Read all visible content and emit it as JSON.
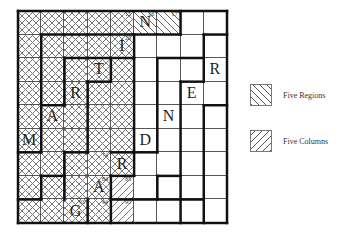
{
  "puzzle": {
    "rows": 9,
    "cols": 9,
    "cells": [
      {
        "r": 0,
        "c": 0,
        "fill": "cross"
      },
      {
        "r": 0,
        "c": 1,
        "fill": "cross"
      },
      {
        "r": 0,
        "c": 2,
        "fill": "cross"
      },
      {
        "r": 0,
        "c": 3,
        "fill": "cross"
      },
      {
        "r": 0,
        "c": 4,
        "fill": "cross",
        "num": "15"
      },
      {
        "r": 0,
        "c": 5,
        "fill": "back",
        "letter": "N",
        "num": "16"
      },
      {
        "r": 0,
        "c": 6,
        "fill": "back",
        "num": "17"
      },
      {
        "r": 1,
        "c": 0,
        "fill": "cross"
      },
      {
        "r": 1,
        "c": 1,
        "fill": "cross"
      },
      {
        "r": 1,
        "c": 2,
        "fill": "cross"
      },
      {
        "r": 1,
        "c": 3,
        "fill": "cross"
      },
      {
        "r": 1,
        "c": 4,
        "fill": "cross",
        "letter": "I",
        "num": "25"
      },
      {
        "r": 2,
        "c": 0,
        "fill": "cross"
      },
      {
        "r": 2,
        "c": 1,
        "fill": "cross"
      },
      {
        "r": 2,
        "c": 2,
        "fill": "cross"
      },
      {
        "r": 2,
        "c": 3,
        "fill": "cross",
        "letter": "T"
      },
      {
        "r": 2,
        "c": 4,
        "fill": "cross"
      },
      {
        "r": 2,
        "c": 8,
        "letter": "R"
      },
      {
        "r": 3,
        "c": 0,
        "fill": "cross"
      },
      {
        "r": 3,
        "c": 1,
        "fill": "cross"
      },
      {
        "r": 3,
        "c": 2,
        "fill": "cross",
        "letter": "R"
      },
      {
        "r": 3,
        "c": 3,
        "fill": "cross"
      },
      {
        "r": 3,
        "c": 4,
        "fill": "cross"
      },
      {
        "r": 3,
        "c": 7,
        "letter": "E"
      },
      {
        "r": 4,
        "c": 0,
        "fill": "cross"
      },
      {
        "r": 4,
        "c": 1,
        "fill": "cross",
        "letter": "A"
      },
      {
        "r": 4,
        "c": 2,
        "fill": "cross"
      },
      {
        "r": 4,
        "c": 3,
        "fill": "cross"
      },
      {
        "r": 4,
        "c": 4,
        "fill": "cross"
      },
      {
        "r": 4,
        "c": 6,
        "letter": "N"
      },
      {
        "r": 5,
        "c": 0,
        "fill": "cross",
        "letter": "M"
      },
      {
        "r": 5,
        "c": 1,
        "fill": "cross"
      },
      {
        "r": 5,
        "c": 2,
        "fill": "cross"
      },
      {
        "r": 5,
        "c": 3,
        "fill": "cross"
      },
      {
        "r": 5,
        "c": 4,
        "fill": "cross"
      },
      {
        "r": 5,
        "c": 5,
        "letter": "D"
      },
      {
        "r": 6,
        "c": 0,
        "fill": "cross"
      },
      {
        "r": 6,
        "c": 1,
        "fill": "cross"
      },
      {
        "r": 6,
        "c": 2,
        "fill": "cross"
      },
      {
        "r": 6,
        "c": 3,
        "fill": "cross",
        "num": "74"
      },
      {
        "r": 6,
        "c": 4,
        "fill": "cross",
        "letter": "R"
      },
      {
        "r": 7,
        "c": 0,
        "fill": "cross"
      },
      {
        "r": 7,
        "c": 1,
        "fill": "cross"
      },
      {
        "r": 7,
        "c": 2,
        "fill": "cross"
      },
      {
        "r": 7,
        "c": 3,
        "fill": "cross",
        "letter": "A",
        "num": "84"
      },
      {
        "r": 7,
        "c": 4,
        "fill": "fwd",
        "num": "85"
      },
      {
        "r": 8,
        "c": 0,
        "fill": "cross"
      },
      {
        "r": 8,
        "c": 1,
        "fill": "cross"
      },
      {
        "r": 8,
        "c": 2,
        "fill": "cross",
        "letter": "G",
        "num": "93"
      },
      {
        "r": 8,
        "c": 3,
        "fill": "cross",
        "num": "94"
      },
      {
        "r": 8,
        "c": 4,
        "fill": "fwd",
        "num": "95"
      }
    ],
    "thick_lines": [
      [
        0,
        0,
        9,
        0
      ],
      [
        9,
        0,
        9,
        9
      ],
      [
        9,
        9,
        0,
        9
      ],
      [
        0,
        9,
        0,
        0
      ],
      [
        5,
        1,
        1,
        1
      ],
      [
        1,
        1,
        1,
        6
      ],
      [
        1,
        6,
        0,
        6
      ],
      [
        7,
        0,
        7,
        1
      ],
      [
        7,
        1,
        5,
        1
      ],
      [
        5,
        1,
        5,
        7
      ],
      [
        5,
        7,
        4,
        7
      ],
      [
        4,
        7,
        4,
        9
      ],
      [
        8,
        1,
        9,
        1
      ],
      [
        8,
        1,
        8,
        3
      ],
      [
        8,
        3,
        7,
        3
      ],
      [
        7,
        3,
        7,
        9
      ],
      [
        2,
        2,
        5,
        2
      ],
      [
        2,
        2,
        2,
        4
      ],
      [
        2,
        4,
        1,
        4
      ],
      [
        4,
        2,
        4,
        3
      ],
      [
        4,
        3,
        3,
        3
      ],
      [
        3,
        3,
        3,
        6
      ],
      [
        3,
        6,
        2,
        6
      ],
      [
        2,
        6,
        2,
        8
      ],
      [
        6,
        2,
        8,
        2
      ],
      [
        6,
        2,
        6,
        6
      ],
      [
        6,
        6,
        5,
        6
      ],
      [
        8,
        4,
        9,
        4
      ],
      [
        8,
        4,
        8,
        9
      ],
      [
        1,
        7,
        1,
        8
      ],
      [
        1,
        8,
        0,
        8
      ],
      [
        1,
        7,
        2,
        7
      ],
      [
        4,
        6,
        5,
        6
      ],
      [
        6,
        7,
        7,
        7
      ],
      [
        6,
        7,
        6,
        8
      ],
      [
        4,
        8,
        8,
        8
      ],
      [
        3,
        8,
        3,
        9
      ]
    ]
  },
  "legend": {
    "items": [
      {
        "label": "Five Regions",
        "fill": "back"
      },
      {
        "label": "Five Columns",
        "fill": "fwd"
      }
    ]
  }
}
